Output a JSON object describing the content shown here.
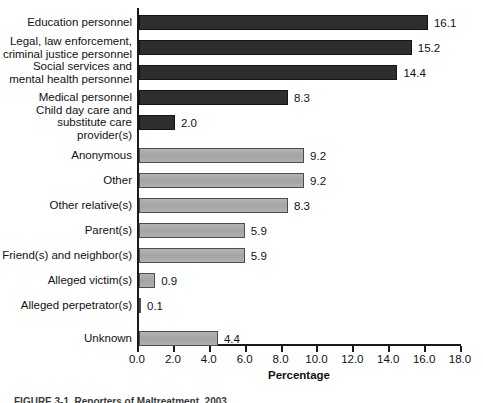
{
  "chart_data": {
    "type": "bar",
    "orientation": "horizontal",
    "title": "",
    "xlabel": "Percentage",
    "ylabel": "",
    "xlim": [
      0.0,
      18.0
    ],
    "xtick_labels": [
      "0.0",
      "2.0",
      "4.0",
      "6.0",
      "8.0",
      "10.0",
      "12.0",
      "14.0",
      "16.0",
      "18.0"
    ],
    "xticks": [
      0.0,
      2.0,
      4.0,
      6.0,
      8.0,
      10.0,
      12.0,
      14.0,
      16.0,
      18.0
    ],
    "grid": false,
    "legend": null,
    "categories": [
      "Education personnel",
      "Legal, law enforcement,\ncriminal justice personnel",
      "Social services and\nmental health personnel",
      "Medical personnel",
      "Child day care and\nsubstitute care provider(s)",
      "Anonymous",
      "Other",
      "Other relative(s)",
      "Parent(s)",
      "Friend(s) and neighbor(s)",
      "Alleged victim(s)",
      "Alleged perpetrator(s)",
      "Unknown"
    ],
    "values": [
      16.1,
      15.2,
      14.4,
      8.3,
      2.0,
      9.2,
      9.2,
      8.3,
      5.9,
      5.9,
      0.9,
      0.1,
      4.4
    ],
    "value_labels": [
      "16.1",
      "15.2",
      "14.4",
      "8.3",
      "2.0",
      "9.2",
      "9.2",
      "8.3",
      "5.9",
      "5.9",
      "0.9",
      "0.1",
      "4.4"
    ],
    "bar_groups": [
      "dark",
      "dark",
      "dark",
      "dark",
      "dark",
      "light",
      "light",
      "light",
      "light",
      "light",
      "light",
      "light",
      "light"
    ],
    "colors": {
      "dark_bar": "#2e2e2e",
      "light_bar": "#a9a9a9",
      "axis": "#1a1a1a",
      "text": "#111111",
      "background": "#ffffff"
    }
  },
  "caption": {
    "text": "FIGURE 3-1.  Reporters of Maltreatment, 2003"
  }
}
